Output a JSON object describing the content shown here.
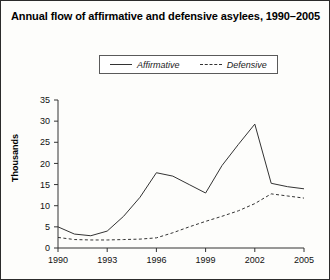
{
  "chart_data": {
    "type": "line",
    "title": "Annual flow of affirmative and defensive asylees, 1990–2005",
    "xlabel": "",
    "ylabel": "Thousands",
    "grid": false,
    "legend_position": "top-center",
    "x": [
      1990,
      1991,
      1992,
      1993,
      1994,
      1995,
      1996,
      1997,
      1998,
      1999,
      2000,
      2001,
      2002,
      2003,
      2004,
      2005
    ],
    "xtick_labels": [
      "1990",
      "1993",
      "1996",
      "1999",
      "2002",
      "2005"
    ],
    "xtick_values": [
      1990,
      1993,
      1996,
      1999,
      2002,
      2005
    ],
    "xlim": [
      1990,
      2005
    ],
    "ytick_labels": [
      "0",
      "5",
      "10",
      "15",
      "20",
      "25",
      "30",
      "35"
    ],
    "ytick_values": [
      0,
      5,
      10,
      15,
      20,
      25,
      30,
      35
    ],
    "ylim": [
      0,
      35
    ],
    "series": [
      {
        "name": "Affirmative",
        "style": "solid",
        "color": "#333333",
        "values": [
          5.0,
          3.3,
          2.9,
          4.0,
          7.5,
          12.0,
          17.8,
          17.0,
          15.0,
          13.0,
          19.5,
          24.5,
          29.3,
          15.3,
          14.5,
          14.0
        ]
      },
      {
        "name": "Defensive",
        "style": "dashed",
        "color": "#333333",
        "values": [
          2.5,
          2.0,
          1.9,
          1.9,
          2.0,
          2.1,
          2.4,
          3.6,
          5.0,
          6.3,
          7.5,
          8.8,
          10.5,
          12.8,
          12.3,
          11.8
        ]
      }
    ]
  },
  "legend": {
    "entries": [
      {
        "label": "Affirmative",
        "swatch": "solid-line-swatch"
      },
      {
        "label": "Defensive",
        "swatch": "dashed-line-swatch"
      }
    ]
  }
}
